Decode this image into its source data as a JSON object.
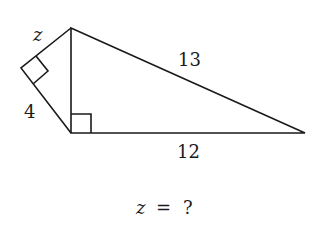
{
  "diagram": {
    "type": "geometry",
    "points": {
      "top": [
        71,
        28
      ],
      "left": [
        21,
        68
      ],
      "bottom": [
        71,
        133
      ],
      "right": [
        305,
        133
      ]
    },
    "labels": {
      "z": "z",
      "four": "4",
      "thirteen": "13",
      "twelve": "12"
    },
    "question": {
      "var": "z",
      "eq": "=",
      "q": "?"
    },
    "stroke_color": "#1a1a1a"
  }
}
